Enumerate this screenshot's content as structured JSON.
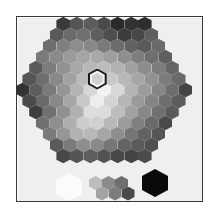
{
  "picker": {
    "title": "Grayscale hexagon color picker",
    "layout": {
      "center_x": 87,
      "center_y": 73,
      "hex_width": 13.6,
      "row_step": 11
    },
    "selected": {
      "row": 5,
      "col": 5
    },
    "rows": [
      [
        "#3a3a3a",
        "#555555",
        "#5c5c5c",
        "#4a4a4a",
        "#2a2a2a",
        "#333333",
        "#2e2e2e"
      ],
      [
        "#5a5a5a",
        "#6a6a6a",
        "#707070",
        "#5e5e5e",
        "#4e4e4e",
        "#3c3c3c",
        "#474747",
        "#5e5e5e"
      ],
      [
        "#6e6e6e",
        "#7f7f7f",
        "#8d8d8d",
        "#888888",
        "#7a7a7a",
        "#6c6c6c",
        "#616161",
        "#5a5a5a",
        "#6a6a6a"
      ],
      [
        "#7a7a7a",
        "#8a8a8a",
        "#9a9a9a",
        "#a5a5a5",
        "#a8a8a8",
        "#9e9e9e",
        "#8e8e8e",
        "#7e7e7e",
        "#6e6e6e",
        "#5f5f5f"
      ],
      [
        "#5a5a5a",
        "#7c7c7c",
        "#929292",
        "#a8a8a8",
        "#b8b8b8",
        "#bcbcbc",
        "#b2b2b2",
        "#a0a0a0",
        "#8c8c8c",
        "#7c7c7c",
        "#666666"
      ],
      [
        "#555555",
        "#6e6e6e",
        "#888888",
        "#a2a2a2",
        "#bcbcbc",
        "#cfcfcf",
        "#c8c8c8",
        "#b8b8b8",
        "#a6a6a6",
        "#929292",
        "#7c7c7c",
        "#6a6a6a"
      ],
      [
        "#333333",
        "#5e5e5e",
        "#7a7a7a",
        "#969696",
        "#b4b4b4",
        "#d6d6d6",
        "#f2f2f2",
        "#d8d8d8",
        "#b4b4b4",
        "#9c9c9c",
        "#868686",
        "#6e6e6e",
        "#444444"
      ],
      [
        "#4a4a4a",
        "#6a6a6a",
        "#888888",
        "#a6a6a6",
        "#c8c8c8",
        "#ededed",
        "#d4d4d4",
        "#b6b6b6",
        "#9a9a9a",
        "#848484",
        "#6e6e6e",
        "#5c5c5c"
      ],
      [
        "#3e3e3e",
        "#707070",
        "#909090",
        "#b0b0b0",
        "#dedede",
        "#dcdcdc",
        "#bebebe",
        "#a2a2a2",
        "#888888",
        "#707070",
        "#5a5a5a"
      ],
      [
        "#707070",
        "#8e8e8e",
        "#aeaeae",
        "#cccccc",
        "#d0d0d0",
        "#b8b8b8",
        "#9c9c9c",
        "#808080",
        "#6a6a6a",
        "#4a4a4a"
      ],
      [
        "#7a7a7a",
        "#969696",
        "#b2b2b2",
        "#b8b8b8",
        "#a6a6a6",
        "#8e8e8e",
        "#767676",
        "#626262",
        "#555555"
      ],
      [
        "#5a5a5a",
        "#7a7a7a",
        "#8e8e8e",
        "#8a8a8a",
        "#767676",
        "#646464",
        "#5a5a5a",
        "#505050"
      ],
      [
        "#484848",
        "#555555",
        "#5e5e5e",
        "#545454",
        "#484848",
        "#444444",
        "#4c4c4c"
      ]
    ],
    "swatches": {
      "white": "#fbfbfb",
      "black": "#0a0a0a",
      "grays_top": [
        "#bdbdbd",
        "#8a8a8a",
        "#6e6e6e"
      ],
      "grays_bottom": [
        "#a3a3a3",
        "#7c7c7c",
        "#4a4a4a"
      ]
    }
  }
}
